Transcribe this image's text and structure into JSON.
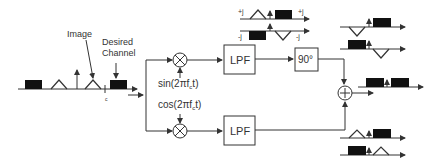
{
  "diagram": {
    "labels": {
      "image": "Image",
      "desired": "Desired",
      "channel": "Channel",
      "fc_mark": "c",
      "sin_lo": "sin(2πf",
      "sin_sub": "c",
      "sin_end": "t)",
      "cos_lo": "cos(2πf",
      "cos_sub": "c",
      "cos_end": "t)",
      "lpf_top": "LPF",
      "lpf_bottom": "LPF",
      "phase_shift": "90°",
      "plus_j": "+j",
      "minus_j": "-j",
      "plus_j_right": "-j",
      "minus_j_right": "-j"
    },
    "blocks": [
      {
        "id": "mixer-top",
        "type": "multiplier"
      },
      {
        "id": "mixer-bottom",
        "type": "multiplier"
      },
      {
        "id": "lpf-top",
        "type": "low-pass-filter"
      },
      {
        "id": "lpf-bottom",
        "type": "low-pass-filter"
      },
      {
        "id": "phase-shifter",
        "type": "90-degree-shift"
      },
      {
        "id": "summer",
        "type": "adder"
      }
    ],
    "colors": {
      "line": "#333333",
      "fill_block": "#111111"
    }
  }
}
